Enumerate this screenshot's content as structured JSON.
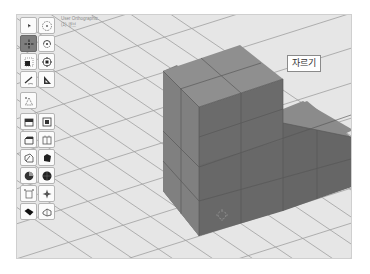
{
  "viewport": {
    "view_name": "User Orthographic",
    "view_subtitle": "(1) 큐브",
    "background": "#e6e6e6",
    "grid_color": "#9e9e9e"
  },
  "tooltip": {
    "label": "자르기"
  },
  "toolbar": {
    "rows": [
      [
        {
          "icon": "select-cursor-icon",
          "active": false
        },
        {
          "icon": "select-circle-icon",
          "active": false
        }
      ],
      [
        {
          "icon": "move-icon",
          "active": true
        },
        {
          "icon": "rotate-icon",
          "active": false
        }
      ],
      [
        {
          "icon": "scale-icon",
          "active": false
        },
        {
          "icon": "transform-icon",
          "active": false
        }
      ],
      [
        {
          "icon": "annotate-icon",
          "active": false
        },
        {
          "icon": "measure-icon",
          "active": false
        }
      ],
      [
        {
          "icon": "add-cone-icon",
          "active": false
        }
      ],
      [
        {
          "icon": "extrude-region-icon",
          "active": false
        },
        {
          "icon": "inset-faces-icon",
          "active": false
        }
      ],
      [
        {
          "icon": "bevel-icon",
          "active": false
        },
        {
          "icon": "loop-cut-icon",
          "active": false
        }
      ],
      [
        {
          "icon": "knife-icon",
          "active": false
        },
        {
          "icon": "poly-build-icon",
          "active": false
        }
      ],
      [
        {
          "icon": "spin-icon",
          "active": false
        },
        {
          "icon": "smooth-icon",
          "active": false
        }
      ],
      [
        {
          "icon": "edge-slide-icon",
          "active": false
        },
        {
          "icon": "shrink-fatten-icon",
          "active": false
        }
      ],
      [
        {
          "icon": "shear-icon",
          "active": false
        },
        {
          "icon": "rip-region-icon",
          "active": false
        }
      ]
    ]
  },
  "object": {
    "name": "stepped-cube-mesh",
    "top_face_color": "#8c8c8c",
    "left_face_color": "#7d7d7d",
    "right_face_color": "#666666",
    "edge_color": "#555555"
  },
  "cursor_3d": {
    "x": 205,
    "y": 200
  }
}
